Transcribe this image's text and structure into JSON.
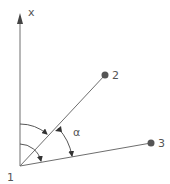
{
  "diagram": {
    "axis_label": "x",
    "angle_label": "α",
    "points": [
      {
        "id": "1",
        "label": "1"
      },
      {
        "id": "2",
        "label": "2"
      },
      {
        "id": "3",
        "label": "3"
      }
    ],
    "colors": {
      "line": "#6e6e6e",
      "point": "#555555",
      "text": "#555555"
    }
  }
}
